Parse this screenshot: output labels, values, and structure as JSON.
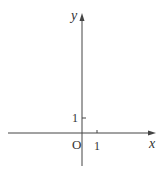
{
  "diagram": {
    "type": "coordinate-axes",
    "origin_label": "O",
    "x_axis_label": "x",
    "y_axis_label": "y",
    "x_tick_label": "1",
    "y_tick_label": "1",
    "colors": {
      "axis": "#444444",
      "text": "#333333"
    }
  }
}
